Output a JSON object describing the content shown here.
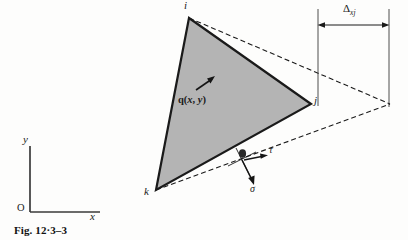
{
  "figure": {
    "caption": "Fig. 12·3–3",
    "nodes": [
      {
        "id": "node-i",
        "label": "i",
        "x": 189,
        "y": 18,
        "label_x": 184,
        "label_y": 1
      },
      {
        "id": "node-j",
        "label": "j",
        "x": 311,
        "y": 104,
        "label_x": 315,
        "label_y": 97
      },
      {
        "id": "node-k",
        "label": "k",
        "x": 156,
        "y": 190,
        "label_x": 145,
        "label_y": 189
      }
    ],
    "element": {
      "fill_color": "#b4b4b4",
      "stroke_color": "#1a1a1a",
      "name": "triangular-element"
    },
    "load": {
      "label_html": "q(<i>x</i>, <i>y</i>)",
      "label_text": "q(x, y)",
      "arrow_from": {
        "x": 196,
        "y": 90
      },
      "arrow_to": {
        "x": 214,
        "y": 78
      }
    },
    "stress": {
      "point": {
        "x": 242,
        "y": 158
      },
      "normal": {
        "label": "σ",
        "label_x": 252,
        "label_y": 188
      },
      "shear": {
        "label": "τ",
        "label_x": 272,
        "label_y": 150
      }
    },
    "dimension": {
      "label": "Δ",
      "subscript": "xj",
      "left_x": 318,
      "right_x": 389,
      "line_y": 25,
      "ext_top_y": 9,
      "ext_bottom_left_y": 106,
      "ext_bottom_right_y": 107
    },
    "projection": {
      "apex": {
        "x": 390,
        "y": 104
      },
      "style": "dashed"
    },
    "axes": {
      "origin_label": "O",
      "x_label": "x",
      "y_label": "y",
      "origin": {
        "x": 30,
        "y": 212
      },
      "x_end": {
        "x": 100,
        "y": 212
      },
      "y_end": {
        "x": 30,
        "y": 146
      },
      "x_label_pos": {
        "x": 92,
        "y": 214
      },
      "y_label_pos": {
        "x": 24,
        "y": 139
      },
      "origin_label_pos": {
        "x": 18,
        "y": 205
      }
    }
  }
}
